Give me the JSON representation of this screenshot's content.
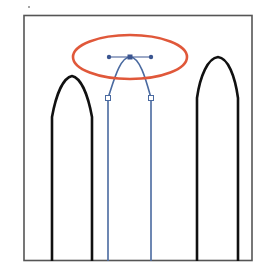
{
  "diagram": {
    "colors": {
      "background": "#ffffff",
      "frame": "#555555",
      "shape_stroke": "#111111",
      "selected_path": "#4a6aa0",
      "anchor": "#3a5590",
      "highlight": "#e0583a"
    },
    "shapes": [
      {
        "id": "left-arch",
        "state": "unselected"
      },
      {
        "id": "middle-arch",
        "state": "selected",
        "anchor_points": 3,
        "handles": 2
      },
      {
        "id": "right-arch",
        "state": "unselected"
      }
    ],
    "highlight": {
      "shape": "ellipse",
      "target": "top-anchor-point"
    }
  }
}
